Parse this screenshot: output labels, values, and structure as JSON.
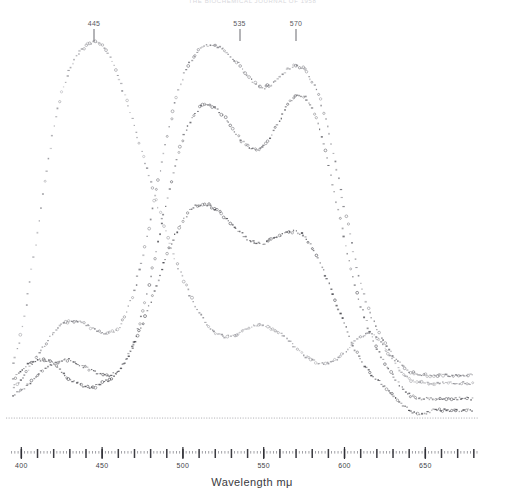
{
  "header": {
    "running_title": "THE BIOCHEMICAL JOURNAL OF 1958"
  },
  "axis": {
    "x_label": "Wavelength  mμ",
    "x_min": 393,
    "x_max": 682,
    "x_ticks_major": [
      400,
      450,
      500,
      550,
      600,
      650
    ],
    "x_tick_labels": [
      "400",
      "450",
      "500",
      "550",
      "600",
      "650"
    ],
    "minor_tick_step": 10,
    "micro_tick_step": 2
  },
  "annotations": [
    {
      "label": "445",
      "wavelength": 445
    },
    {
      "label": "535",
      "wavelength": 535
    },
    {
      "label": "570",
      "wavelength": 570
    }
  ],
  "colors": {
    "ink": "#3a3a3e",
    "faint_ink": "#8d8d93",
    "baseline": "#9a9aa0",
    "paper": "#ffffff",
    "header": "#d8d8dc"
  },
  "chart_data": {
    "type": "line",
    "title": "",
    "subtitle": "",
    "xlabel": "Wavelength  mμ",
    "ylabel": "",
    "xlim": [
      393,
      682
    ],
    "ylim": [
      0,
      100
    ],
    "grid": false,
    "legend": "none",
    "baseline_value": 6,
    "series": [
      {
        "name": "curve-1",
        "marker": "open-circle",
        "tone": "#8f8f95",
        "x": [
          395,
          400,
          405,
          410,
          415,
          420,
          425,
          430,
          435,
          440,
          445,
          450,
          455,
          460,
          465,
          470,
          475,
          480,
          485,
          490,
          495,
          500,
          505,
          510,
          515,
          520,
          525,
          530,
          535,
          540,
          545,
          550,
          555,
          560,
          565,
          570,
          575,
          580,
          585,
          590,
          595,
          600,
          605,
          610,
          615,
          620,
          625,
          630,
          635,
          640,
          645,
          650,
          655,
          660,
          665,
          670,
          675,
          680
        ],
        "y": [
          14,
          22,
          34,
          48,
          62,
          75,
          84,
          90,
          94,
          96,
          97,
          96,
          93,
          88,
          82,
          75,
          68,
          61,
          54,
          47,
          41,
          36,
          31,
          27,
          24,
          22,
          21,
          21,
          22,
          23,
          24,
          24,
          23,
          22,
          20,
          18,
          16,
          15,
          14,
          14,
          15,
          17,
          19,
          21,
          22,
          21,
          18,
          15,
          12,
          10,
          9,
          9,
          9,
          9,
          9,
          9,
          9,
          9
        ]
      },
      {
        "name": "curve-2",
        "marker": "open-circle",
        "tone": "#7c7c82",
        "x": [
          395,
          400,
          405,
          410,
          415,
          420,
          425,
          430,
          435,
          440,
          445,
          450,
          455,
          460,
          465,
          470,
          475,
          480,
          485,
          490,
          495,
          500,
          505,
          510,
          515,
          520,
          525,
          530,
          535,
          540,
          545,
          550,
          555,
          560,
          565,
          570,
          575,
          580,
          585,
          590,
          595,
          600,
          605,
          610,
          615,
          620,
          625,
          630,
          635,
          640,
          645,
          650,
          655,
          660,
          665,
          670,
          675,
          680
        ],
        "y": [
          8,
          10,
          13,
          16,
          19,
          22,
          24,
          25,
          25,
          24,
          23,
          22,
          22,
          23,
          27,
          33,
          41,
          51,
          62,
          72,
          81,
          88,
          92,
          95,
          96,
          96,
          95,
          93,
          91,
          88,
          86,
          85,
          86,
          88,
          90,
          91,
          90,
          87,
          82,
          74,
          64,
          54,
          44,
          35,
          28,
          23,
          19,
          16,
          14,
          12,
          11,
          11,
          11,
          11,
          11,
          11,
          11,
          11
        ]
      },
      {
        "name": "curve-3",
        "marker": "small-dot",
        "tone": "#5d5d63",
        "x": [
          395,
          400,
          405,
          410,
          415,
          420,
          425,
          430,
          435,
          440,
          445,
          450,
          455,
          460,
          465,
          470,
          475,
          480,
          485,
          490,
          495,
          500,
          505,
          510,
          515,
          520,
          525,
          530,
          535,
          540,
          545,
          550,
          555,
          560,
          565,
          570,
          575,
          580,
          585,
          590,
          595,
          600,
          605,
          610,
          615,
          620,
          625,
          630,
          635,
          640,
          645,
          650,
          655,
          660,
          665,
          670,
          675,
          680
        ],
        "y": [
          6,
          7,
          9,
          11,
          13,
          14,
          15,
          15,
          14,
          13,
          12,
          11,
          11,
          12,
          15,
          20,
          27,
          36,
          46,
          56,
          65,
          72,
          77,
          80,
          81,
          80,
          78,
          75,
          72,
          70,
          69,
          70,
          73,
          77,
          81,
          83,
          83,
          80,
          74,
          66,
          56,
          46,
          37,
          29,
          23,
          18,
          14,
          11,
          8,
          6,
          5,
          5,
          5,
          5,
          5,
          5,
          5,
          5
        ]
      },
      {
        "name": "curve-4",
        "marker": "dot",
        "tone": "#4a4a50",
        "x": [
          395,
          400,
          405,
          410,
          415,
          420,
          425,
          430,
          435,
          440,
          445,
          450,
          455,
          460,
          465,
          470,
          475,
          480,
          485,
          490,
          495,
          500,
          505,
          510,
          515,
          520,
          525,
          530,
          535,
          540,
          545,
          550,
          555,
          560,
          565,
          570,
          575,
          580,
          585,
          590,
          595,
          600,
          605,
          610,
          615,
          620,
          625,
          630,
          635,
          640,
          645,
          650,
          655,
          660,
          665,
          670,
          675,
          680
        ],
        "y": [
          10,
          12,
          14,
          15,
          15,
          14,
          12,
          10,
          9,
          8,
          8,
          9,
          10,
          12,
          15,
          19,
          24,
          30,
          36,
          42,
          47,
          51,
          54,
          55,
          55,
          54,
          52,
          50,
          48,
          46,
          45,
          45,
          46,
          47,
          48,
          48,
          47,
          44,
          40,
          35,
          29,
          24,
          19,
          15,
          12,
          10,
          8,
          6,
          4,
          2,
          1,
          1,
          2,
          2,
          2,
          2,
          2,
          2
        ]
      }
    ]
  }
}
